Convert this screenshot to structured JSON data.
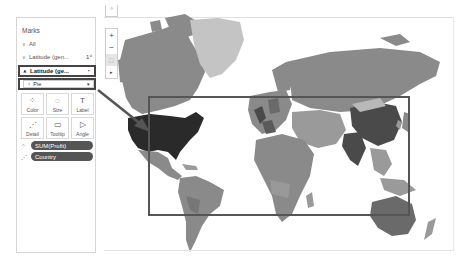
{
  "marks_card": {
    "title": "Marks",
    "layers": [
      {
        "label": "All",
        "chevron": "down"
      },
      {
        "label": "Latitude (gen...",
        "chevron": "down",
        "trailing_icon": "dual-axis-icon",
        "trailing_glyph": "1⁴"
      },
      {
        "label": "Latitude (ge...",
        "chevron": "up",
        "trailing_icon": "pie-icon",
        "trailing_glyph": "◔",
        "selected": true
      }
    ],
    "mark_type": {
      "icon": "◔",
      "value": "Pie",
      "caret": "▾"
    },
    "cards": [
      {
        "label": "Color",
        "icon": "⁘"
      },
      {
        "label": "Size",
        "icon": "◌"
      },
      {
        "label": "Label",
        "icon": "T"
      },
      {
        "label": "Detail",
        "icon": "⋰"
      },
      {
        "label": "Tooltip",
        "icon": "▭"
      },
      {
        "label": "Angle",
        "icon": "▷"
      }
    ],
    "pills": [
      {
        "label": "SUM(Profit)",
        "icon": "⁘"
      },
      {
        "label": "Country",
        "icon": "⋰"
      }
    ]
  },
  "map_toolbar": {
    "zoom_in": "+",
    "zoom_out": "−",
    "select_tool": "⬚",
    "expand": "▸"
  },
  "map": {
    "highlighted_country": "United States",
    "colors": {
      "ocean": "#ffffff",
      "land": "#8a8a8a",
      "land_light": "#c4c4c4",
      "land_dark": "#4a4a4a",
      "usa": "#2a2a2a",
      "selection_border": "#555555",
      "annotation_arrow": "#555555"
    }
  }
}
